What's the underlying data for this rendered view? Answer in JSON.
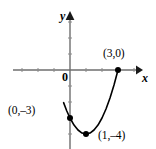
{
  "figure": {
    "kind": "coordinate-plane-parabola",
    "background_color": "#ffffff",
    "axis_color": "#6e6e6e",
    "curve_color": "#000000",
    "point_color": "#000000"
  },
  "axes": {
    "x_label": "x",
    "y_label": "y",
    "origin_label": "0",
    "x_axis_pixel_y": 70,
    "y_axis_pixel_x": 70,
    "x_axis_from_px": 13,
    "x_axis_to_px": 141,
    "y_axis_from_px": 13,
    "y_axis_to_px": 149,
    "unit_px": 16,
    "tick_length_px": 4,
    "x_ticks": [
      -3,
      -2,
      -1,
      1,
      2,
      3,
      4
    ],
    "y_ticks": [
      -4,
      -3,
      -2,
      -1,
      1,
      2,
      3
    ]
  },
  "chart_data": {
    "type": "line",
    "title": "",
    "xlabel": "x",
    "ylabel": "y",
    "grid": false,
    "legend": "none",
    "xlim": [
      -3.6,
      4.4
    ],
    "ylim": [
      -4.9,
      3.6
    ],
    "series": [
      {
        "name": "parabola",
        "equation": "y = x^2 - 2x - 3",
        "x": [
          -0.4,
          -0.2,
          0.0,
          0.25,
          0.5,
          0.75,
          1.0,
          1.25,
          1.5,
          1.75,
          2.0,
          2.25,
          2.5,
          2.75,
          3.0
        ],
        "y": [
          -2.04,
          -2.56,
          -3.0,
          -3.44,
          -3.75,
          -3.94,
          -4.0,
          -3.94,
          -3.75,
          -3.44,
          -3.0,
          -2.44,
          -1.75,
          -0.94,
          0.0
        ]
      }
    ],
    "points": [
      {
        "label": "(3,0)",
        "x": 3,
        "y": 0,
        "pixel_x": 118,
        "pixel_y": 70,
        "label_position": "above-left"
      },
      {
        "label": "(0,–3)",
        "x": 0,
        "y": -3,
        "pixel_x": 70,
        "pixel_y": 113,
        "label_position": "left"
      },
      {
        "label": "(1,–4)",
        "x": 1,
        "y": -4,
        "pixel_x": 86,
        "pixel_y": 131,
        "label_position": "right"
      }
    ]
  }
}
